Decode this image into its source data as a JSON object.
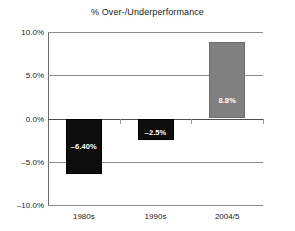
{
  "chart_data": {
    "type": "bar",
    "title": "% Over-/Underperformance",
    "xlabel": "",
    "ylabel": "",
    "categories": [
      "1980s",
      "1990s",
      "2004/5"
    ],
    "values": [
      -6.4,
      -2.5,
      8.8
    ],
    "point_labels": [
      "–6.40%",
      "–2.5%",
      "8.8%"
    ],
    "bar_colors": [
      "#0d0d0d",
      "#0d0d0d",
      "#808080"
    ],
    "ylim": [
      -10.0,
      10.0
    ],
    "yticks": [
      10.0,
      5.0,
      0.0,
      -5.0,
      -10.0
    ],
    "ytick_labels": [
      "10.0%",
      "5.0%",
      "0.0%",
      "–5.0%",
      "–10.0%"
    ],
    "grid": true,
    "legend": false,
    "legend_position": "none"
  },
  "axis": {
    "zero_line_value": "0.0%"
  }
}
